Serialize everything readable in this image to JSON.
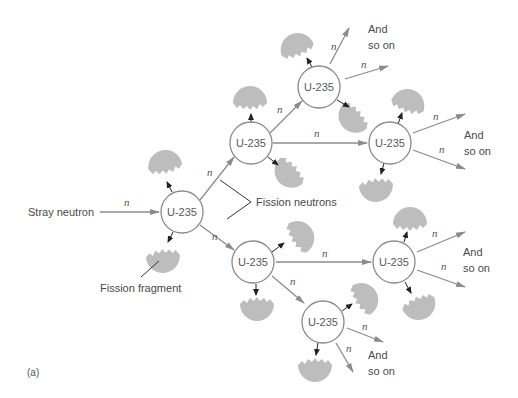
{
  "diagram": {
    "caption": "(a)",
    "node_label": "U-235",
    "neutron_symbol": "n",
    "labels": {
      "stray_neutron": "Stray neutron",
      "fission_neutrons": "Fission neutrons",
      "fission_fragment": "Fission fragment",
      "and": "And",
      "so_on": "so on"
    },
    "colors": {
      "node_stroke": "#8a8a8a",
      "arrow": "#8c8c8c",
      "fragment_fill": "#bdbdbd",
      "text": "#4a4a4a",
      "small_arrow": "#222222"
    },
    "nodes": [
      {
        "id": "n1",
        "label": "U-235",
        "x": 182,
        "y": 212
      },
      {
        "id": "n2",
        "label": "U-235",
        "x": 251,
        "y": 143
      },
      {
        "id": "n3",
        "label": "U-235",
        "x": 319,
        "y": 87
      },
      {
        "id": "n4",
        "label": "U-235",
        "x": 390,
        "y": 143
      },
      {
        "id": "n5",
        "label": "U-235",
        "x": 253,
        "y": 262
      },
      {
        "id": "n6",
        "label": "U-235",
        "x": 394,
        "y": 262
      },
      {
        "id": "n7",
        "label": "U-235",
        "x": 323,
        "y": 322
      }
    ],
    "edges": [
      {
        "from": "stray",
        "to": "n1",
        "label": "n"
      },
      {
        "from": "n1",
        "to": "n2",
        "label": "n"
      },
      {
        "from": "n1",
        "to": "n5",
        "label": "n"
      },
      {
        "from": "n2",
        "to": "n3",
        "label": "n"
      },
      {
        "from": "n2",
        "to": "n4",
        "label": "n"
      },
      {
        "from": "n3",
        "to": "and-so-on-top",
        "label": "n"
      },
      {
        "from": "n3",
        "to": "n4-direction",
        "label": "n"
      },
      {
        "from": "n4",
        "to": "and-so-on-right-upper",
        "label": "n"
      },
      {
        "from": "n5",
        "to": "n6",
        "label": "n"
      },
      {
        "from": "n5",
        "to": "n7",
        "label": "n"
      },
      {
        "from": "n6",
        "to": "and-so-on-right-lower",
        "label": "n"
      },
      {
        "from": "n7",
        "to": "and-so-on-bottom",
        "label": "n"
      }
    ]
  }
}
